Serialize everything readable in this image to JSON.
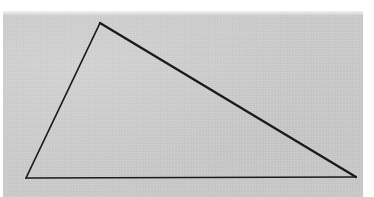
{
  "document": {
    "kind": "scanned-geometry-figure",
    "caption": "",
    "background_color": "#ffffff",
    "paper_color": "#cccccc",
    "ink_color": "#1a1a1a"
  },
  "paper": {
    "x": 3,
    "y": 11,
    "width": 360,
    "height": 186
  },
  "figure": {
    "name": "triangle",
    "label": "",
    "filled": false,
    "stroke_color": "#1a1a1a",
    "vertices": [
      {
        "name": "apex",
        "label": "",
        "x": 100,
        "y": 23
      },
      {
        "name": "bottom-right",
        "label": "",
        "x": 356,
        "y": 177
      },
      {
        "name": "bottom-left",
        "label": "",
        "x": 26,
        "y": 178
      }
    ],
    "edges": [
      {
        "name": "hypotenuse",
        "from": "apex",
        "to": "bottom-right",
        "stroke_width": 2.3
      },
      {
        "name": "base",
        "from": "bottom-right",
        "to": "bottom-left",
        "stroke_width": 1.7
      },
      {
        "name": "left-side",
        "from": "bottom-left",
        "to": "apex",
        "stroke_width": 1.7
      }
    ],
    "points_string": "100,23 356,177 26,178"
  }
}
